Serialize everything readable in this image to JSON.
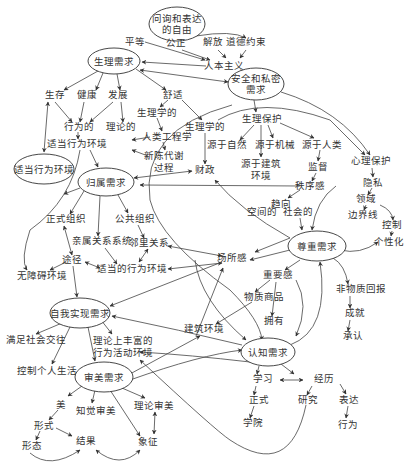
{
  "diagram": {
    "type": "concept-map",
    "colors": {
      "line": "#444444",
      "text": "#333333",
      "background": "#ffffff"
    },
    "ellipse_nodes": [
      {
        "id": "freedom",
        "label_lines": [
          "问询和表达",
          "的自由"
        ],
        "cx": 177,
        "cy": 24,
        "rx": 28,
        "ry": 17
      },
      {
        "id": "physio",
        "label_lines": [
          "生理需求"
        ],
        "cx": 114,
        "cy": 61,
        "rx": 26,
        "ry": 13
      },
      {
        "id": "safety",
        "label_lines": [
          "安全和私密",
          "需求"
        ],
        "cx": 256,
        "cy": 84,
        "rx": 28,
        "ry": 16
      },
      {
        "id": "fit_env",
        "label_lines": [
          "适当行为环境"
        ],
        "cx": 44,
        "cy": 169,
        "rx": 30,
        "ry": 15
      },
      {
        "id": "belong",
        "label_lines": [
          "归属需求"
        ],
        "cx": 106,
        "cy": 182,
        "rx": 28,
        "ry": 14
      },
      {
        "id": "esteem",
        "label_lines": [
          "尊重需求"
        ],
        "cx": 317,
        "cy": 246,
        "rx": 29,
        "ry": 15
      },
      {
        "id": "self_act",
        "label_lines": [
          "自我实现需求"
        ],
        "cx": 80,
        "cy": 313,
        "rx": 30,
        "ry": 15
      },
      {
        "id": "cognitive",
        "label_lines": [
          "认知需求"
        ],
        "cx": 268,
        "cy": 352,
        "rx": 27,
        "ry": 14
      },
      {
        "id": "aesthetic",
        "label_lines": [
          "审美需求"
        ],
        "cx": 104,
        "cy": 377,
        "rx": 29,
        "ry": 15
      }
    ],
    "text_nodes": [
      {
        "id": "equal",
        "label": "平等",
        "x": 135,
        "y": 45
      },
      {
        "id": "justice",
        "label": "公正",
        "x": 176,
        "y": 46
      },
      {
        "id": "liberation",
        "label": "解放",
        "x": 213,
        "y": 45
      },
      {
        "id": "moral",
        "label": "道德约束",
        "x": 246,
        "y": 45
      },
      {
        "id": "humanism",
        "label": "人本主义",
        "x": 224,
        "y": 66
      },
      {
        "id": "survival",
        "label": "生存",
        "x": 55,
        "y": 96
      },
      {
        "id": "health",
        "label": "健康",
        "x": 87,
        "y": 96
      },
      {
        "id": "develop",
        "label": "发展",
        "x": 118,
        "y": 96
      },
      {
        "id": "comfort",
        "label": "舒适",
        "x": 173,
        "y": 96
      },
      {
        "id": "physiological1",
        "label": "生理学的",
        "x": 157,
        "y": 113
      },
      {
        "id": "behavioral",
        "label": "行为的",
        "x": 79,
        "y": 128
      },
      {
        "id": "theoretical",
        "label": "理论的",
        "x": 121,
        "y": 128
      },
      {
        "id": "physiological2",
        "label": "生理学的",
        "x": 205,
        "y": 127
      },
      {
        "id": "ergonomics",
        "label": "人类工程学",
        "x": 167,
        "y": 137
      },
      {
        "id": "fit_behav_env",
        "label": "适当行为环境",
        "x": 77,
        "y": 145
      },
      {
        "id": "metabolism",
        "label": "新陈代谢",
        "x": 164,
        "y": 157
      },
      {
        "id": "process",
        "label": "过程",
        "x": 164,
        "y": 170
      },
      {
        "id": "physio_protect",
        "label": "生理保护",
        "x": 262,
        "y": 120
      },
      {
        "id": "from_nature",
        "label": "源于自然",
        "x": 227,
        "y": 145
      },
      {
        "id": "from_machine",
        "label": "源于机械",
        "x": 275,
        "y": 145
      },
      {
        "id": "from_human",
        "label": "源于人类",
        "x": 322,
        "y": 145
      },
      {
        "id": "from_building",
        "label": "源于建筑",
        "x": 228,
        "y": 164
      },
      {
        "id": "from_building2",
        "label": "环境",
        "x": 228,
        "y": 177
      },
      {
        "id": "finance",
        "label": "财政",
        "x": 205,
        "y": 171
      },
      {
        "id": "supervise",
        "label": "监督",
        "x": 318,
        "y": 168
      },
      {
        "id": "psych_protect",
        "label": "心理保护",
        "x": 371,
        "y": 162
      },
      {
        "id": "order",
        "label": "秩序感",
        "x": 310,
        "y": 187
      },
      {
        "id": "privacy",
        "label": "隐私",
        "x": 373,
        "y": 183
      },
      {
        "id": "tend",
        "label": "趋向",
        "x": 281,
        "y": 205
      },
      {
        "id": "territory",
        "label": "领域",
        "x": 366,
        "y": 200
      },
      {
        "id": "spatial",
        "label": "空间的",
        "x": 262,
        "y": 213
      },
      {
        "id": "social",
        "label": "社会的",
        "x": 298,
        "y": 213
      },
      {
        "id": "boundary",
        "label": "边界线",
        "x": 363,
        "y": 216
      },
      {
        "id": "control",
        "label": "控制",
        "x": 392,
        "y": 226
      },
      {
        "id": "individuality",
        "label": "个性化",
        "x": 389,
        "y": 242
      },
      {
        "id": "formal_org",
        "label": "正式组织",
        "x": 66,
        "y": 220
      },
      {
        "id": "public_org",
        "label": "公共组织",
        "x": 135,
        "y": 220
      },
      {
        "id": "kinship",
        "label": "亲属关系系统",
        "x": 102,
        "y": 242
      },
      {
        "id": "neighbor",
        "label": "邻里关系",
        "x": 149,
        "y": 244
      },
      {
        "id": "path",
        "label": "途径",
        "x": 72,
        "y": 261
      },
      {
        "id": "proper_env",
        "label": "适当的行为环境",
        "x": 132,
        "y": 270
      },
      {
        "id": "barrier_free",
        "label": "无障碍环境",
        "x": 42,
        "y": 277
      },
      {
        "id": "place_sense",
        "label": "场所感",
        "x": 232,
        "y": 259
      },
      {
        "id": "importance",
        "label": "重要感",
        "x": 278,
        "y": 276
      },
      {
        "id": "nonmaterial",
        "label": "非物质回报",
        "x": 361,
        "y": 290
      },
      {
        "id": "goods",
        "label": "物质商品",
        "x": 264,
        "y": 298
      },
      {
        "id": "achievement",
        "label": "成就",
        "x": 355,
        "y": 314
      },
      {
        "id": "own",
        "label": "拥有",
        "x": 274,
        "y": 322
      },
      {
        "id": "building_env",
        "label": "建筑环境",
        "x": 204,
        "y": 330
      },
      {
        "id": "recognition",
        "label": "承认",
        "x": 353,
        "y": 337
      },
      {
        "id": "social_exchange",
        "label": "满足社会交往",
        "x": 36,
        "y": 340
      },
      {
        "id": "rich_env1",
        "label": "理论上丰富的",
        "x": 121,
        "y": 341
      },
      {
        "id": "rich_env2",
        "label": "行为活动环境",
        "x": 121,
        "y": 353
      },
      {
        "id": "control_life",
        "label": "控制个人生活",
        "x": 47,
        "y": 371
      },
      {
        "id": "beauty",
        "label": "美",
        "x": 61,
        "y": 406
      },
      {
        "id": "perceptual",
        "label": "知觉审美",
        "x": 96,
        "y": 412
      },
      {
        "id": "theory_aes",
        "label": "理论审美",
        "x": 154,
        "y": 407
      },
      {
        "id": "form",
        "label": "形式",
        "x": 44,
        "y": 427
      },
      {
        "id": "result",
        "label": "结果",
        "x": 86,
        "y": 442
      },
      {
        "id": "symbol",
        "label": "象征",
        "x": 148,
        "y": 443
      },
      {
        "id": "shape",
        "label": "形态",
        "x": 32,
        "y": 447
      },
      {
        "id": "learning",
        "label": "学习",
        "x": 263,
        "y": 380
      },
      {
        "id": "experience",
        "label": "经历",
        "x": 324,
        "y": 380
      },
      {
        "id": "formal",
        "label": "正式",
        "x": 259,
        "y": 401
      },
      {
        "id": "research",
        "label": "研究",
        "x": 308,
        "y": 401
      },
      {
        "id": "express",
        "label": "表达",
        "x": 349,
        "y": 401
      },
      {
        "id": "academy",
        "label": "学院",
        "x": 253,
        "y": 424
      },
      {
        "id": "behavior",
        "label": "行为",
        "x": 348,
        "y": 426
      }
    ]
  }
}
